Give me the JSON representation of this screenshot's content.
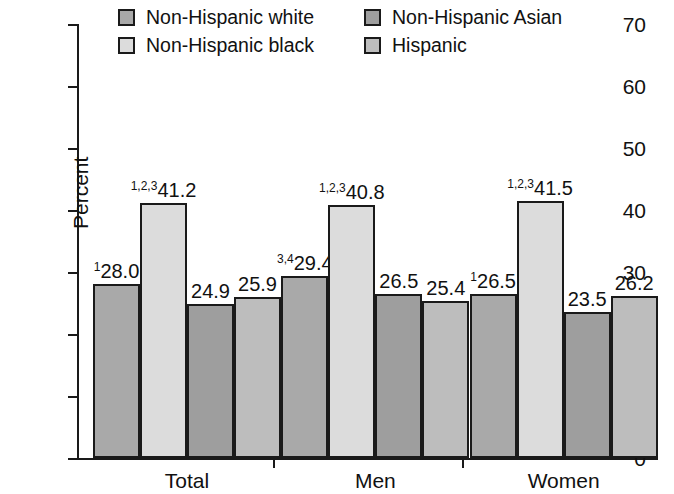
{
  "chart_data": {
    "type": "bar",
    "title": "",
    "xlabel": "",
    "ylabel": "Percent",
    "ylim": [
      0,
      70
    ],
    "yticks": [
      0,
      10,
      20,
      30,
      40,
      50,
      60,
      70
    ],
    "ytick_labels": [
      "0",
      "10",
      "20",
      "30",
      "40",
      "50",
      "60",
      "70"
    ],
    "grid": false,
    "legend_position": "top",
    "categories": [
      "Total",
      "Men",
      "Women"
    ],
    "series": [
      {
        "name": "Non-Hispanic white",
        "color": "#a9a9a9",
        "values": [
          28.0,
          29.4,
          26.5
        ],
        "labels": [
          "28.0",
          "29.4",
          "26.5"
        ],
        "footnotes": [
          "1",
          "3,4",
          "1"
        ]
      },
      {
        "name": "Non-Hispanic black",
        "color": "#dcdcdc",
        "values": [
          41.2,
          40.8,
          41.5
        ],
        "labels": [
          "41.2",
          "40.8",
          "41.5"
        ],
        "footnotes": [
          "1,2,3",
          "1,2,3",
          "1,2,3"
        ]
      },
      {
        "name": "Non-Hispanic Asian",
        "color": "#9e9e9e",
        "values": [
          24.9,
          26.5,
          23.5
        ],
        "labels": [
          "24.9",
          "26.5",
          "23.5"
        ],
        "footnotes": [
          "",
          "",
          ""
        ]
      },
      {
        "name": "Hispanic",
        "color": "#bdbdbd",
        "values": [
          25.9,
          25.4,
          26.2
        ],
        "labels": [
          "25.9",
          "25.4",
          "26.2"
        ],
        "footnotes": [
          "",
          "",
          ""
        ]
      }
    ]
  },
  "legend": {
    "items": [
      {
        "label": "Non-Hispanic white",
        "color": "#a9a9a9"
      },
      {
        "label": "Non-Hispanic black",
        "color": "#dcdcdc"
      },
      {
        "label": "Non-Hispanic Asian",
        "color": "#9e9e9e"
      },
      {
        "label": "Hispanic",
        "color": "#bdbdbd"
      }
    ]
  }
}
